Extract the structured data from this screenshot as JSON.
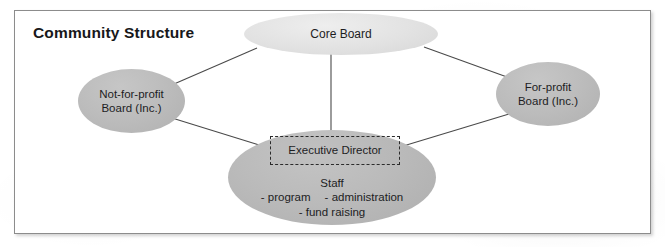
{
  "diagram": {
    "title": "Community Structure",
    "nodes": {
      "core_board": {
        "label": "Core Board",
        "fill": "#e2e2e2"
      },
      "not_for_profit": {
        "label": "Not-for-profit\nBoard (Inc.)",
        "fill": "#bcbcbc"
      },
      "for_profit": {
        "label": "For-profit\nBoard (Inc.)",
        "fill": "#bcbcbc"
      },
      "executive": {
        "label": "Executive Director",
        "fill": "#bababa",
        "border_style": "dashed"
      }
    },
    "staff": {
      "heading": "Staff",
      "item_program": "- program",
      "item_administration": "- administration",
      "item_fund_raising": "- fund raising"
    },
    "style": {
      "frame_border": "#8c8c8c",
      "line_color": "#4a4a4a",
      "text_color": "#1d1d1f",
      "background": "#ffffff"
    }
  }
}
